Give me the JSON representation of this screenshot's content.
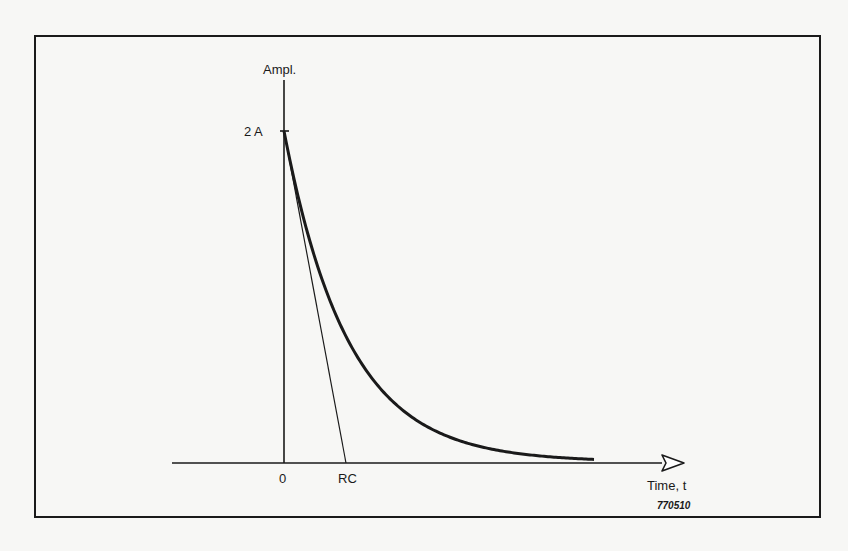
{
  "diagram": {
    "y_axis_label": "Ampl.",
    "x_axis_label": "Time, t",
    "peak_label": "2 A",
    "origin_label": "0",
    "rc_label": "RC",
    "figure_code": "770510",
    "curve": "exponential decay from 2A at t=0 toward 0",
    "tangent": "initial-slope tangent line intersecting time axis at t=RC",
    "colors": {
      "ink": "#1a1a1a",
      "paper": "#f7f7f5"
    }
  }
}
